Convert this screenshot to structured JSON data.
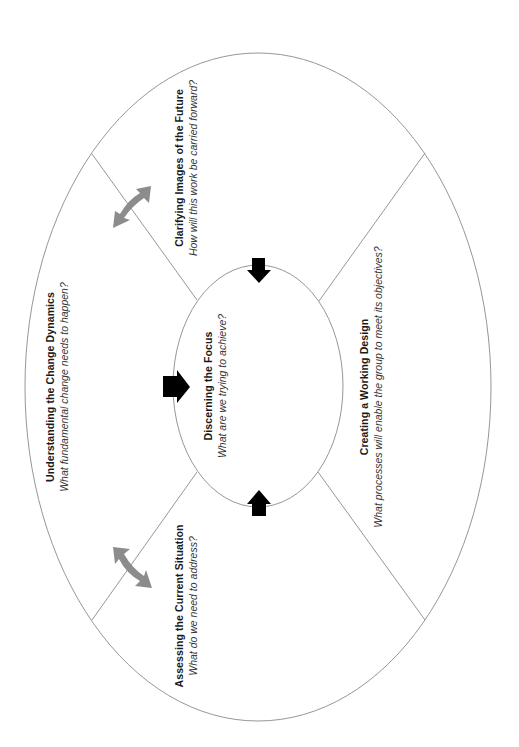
{
  "diagram": {
    "colors": {
      "background": "#ffffff",
      "outline": "#8a8a8a",
      "focus_arrow": "#000000",
      "cycle_arrow": "#8c8c8c",
      "text": "#1a1a1a"
    },
    "center": {
      "id": "discerning-the-focus",
      "title": "Discerning the Focus",
      "question": "What are we trying to achieve?"
    },
    "sectors": [
      {
        "id": "understanding-the-change-dynamics",
        "position": "left",
        "title": "Understanding the Change Dynamics",
        "question": "What fundamental change needs to happen?"
      },
      {
        "id": "clarifying-images-of-the-future",
        "position": "top",
        "title": "Clarifying Images of the Future",
        "question": "How will this work be carried forward?"
      },
      {
        "id": "creating-a-working-design",
        "position": "right",
        "title": "Creating a Working Design",
        "question": "What processes will enable the group to meet its objectives?"
      },
      {
        "id": "assessing-the-current-situation",
        "position": "bottom",
        "title": "Assessing the Current Situation",
        "question": "What do we need to address?"
      }
    ],
    "arrows": {
      "focus_arrows": [
        {
          "from": "clarifying-images-of-the-future",
          "to": "discerning-the-focus",
          "direction": "down"
        },
        {
          "from": "understanding-the-change-dynamics",
          "to": "discerning-the-focus",
          "direction": "right"
        },
        {
          "from": "assessing-the-current-situation",
          "to": "discerning-the-focus",
          "direction": "up"
        }
      ],
      "cycle_arrows": [
        {
          "between": [
            "understanding-the-change-dynamics",
            "clarifying-images-of-the-future"
          ],
          "type": "double-headed"
        },
        {
          "between": [
            "understanding-the-change-dynamics",
            "assessing-the-current-situation"
          ],
          "type": "double-headed"
        }
      ]
    }
  }
}
